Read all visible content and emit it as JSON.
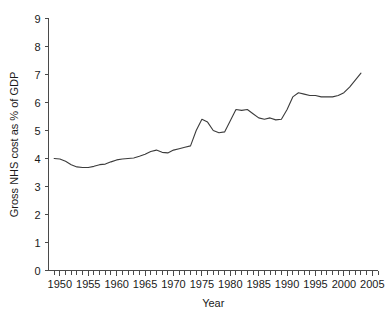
{
  "chart_data": {
    "type": "line",
    "title": "",
    "xlabel": "Year",
    "ylabel": "Gross NHS cost as % of GDP",
    "xlim": [
      1948,
      2006
    ],
    "ylim": [
      0,
      9
    ],
    "grid": false,
    "legend": "none",
    "x_major_ticks": [
      1950,
      1955,
      1960,
      1965,
      1970,
      1975,
      1980,
      1985,
      1990,
      1995,
      2000,
      2005
    ],
    "x_major_tick_labels": [
      "1950",
      "1955",
      "1960",
      "1965",
      "1970",
      "1975",
      "1980",
      "1985",
      "1990",
      "1995",
      "2000",
      "2005"
    ],
    "x_minor_tick_step": 1,
    "y_ticks": [
      0,
      1,
      2,
      3,
      4,
      5,
      6,
      7,
      8,
      9
    ],
    "y_tick_labels": [
      "0",
      "1",
      "2",
      "3",
      "4",
      "5",
      "6",
      "7",
      "8",
      "9"
    ],
    "series": [
      {
        "name": "Gross NHS cost as % of GDP",
        "color": "#3c3c3c",
        "x": [
          1949,
          1950,
          1951,
          1952,
          1953,
          1954,
          1955,
          1956,
          1957,
          1958,
          1959,
          1960,
          1961,
          1962,
          1963,
          1964,
          1965,
          1966,
          1967,
          1968,
          1969,
          1970,
          1971,
          1972,
          1973,
          1974,
          1975,
          1976,
          1977,
          1978,
          1979,
          1980,
          1981,
          1982,
          1983,
          1984,
          1985,
          1986,
          1987,
          1988,
          1989,
          1990,
          1991,
          1992,
          1993,
          1994,
          1995,
          1996,
          1997,
          1998,
          1999,
          2000,
          2001,
          2002,
          2003
        ],
        "values": [
          4.0,
          3.98,
          3.9,
          3.78,
          3.7,
          3.68,
          3.68,
          3.72,
          3.78,
          3.8,
          3.88,
          3.95,
          3.98,
          4.0,
          4.02,
          4.08,
          4.15,
          4.25,
          4.3,
          4.22,
          4.2,
          4.3,
          4.35,
          4.4,
          4.45,
          5.0,
          5.4,
          5.3,
          5.0,
          4.92,
          4.95,
          5.35,
          5.75,
          5.72,
          5.75,
          5.6,
          5.45,
          5.4,
          5.45,
          5.38,
          5.4,
          5.75,
          6.2,
          6.35,
          6.3,
          6.25,
          6.25,
          6.2,
          6.2,
          6.2,
          6.25,
          6.35,
          6.55,
          6.8,
          7.05
        ]
      }
    ]
  },
  "axes": {
    "y_axis_title": "Gross NHS cost as % of GDP",
    "x_axis_title": "Year"
  }
}
